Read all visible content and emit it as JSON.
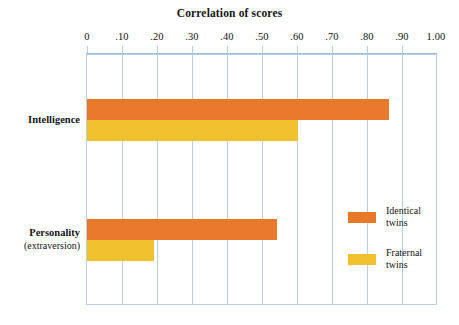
{
  "chart_data": {
    "type": "bar",
    "orientation": "horizontal",
    "title": "Correlation of scores",
    "xlabel": "Correlation of scores",
    "ylabel": "",
    "xlim": [
      0,
      1.0
    ],
    "grid": true,
    "legend_position": "right-inside",
    "categories": [
      "Intelligence",
      "Personality (extraversion)"
    ],
    "category_lines": [
      [
        "Intelligence"
      ],
      [
        "Personality",
        "(extraversion)"
      ]
    ],
    "tick_labels": [
      "0",
      ".10",
      ".20",
      ".30",
      ".40",
      ".50",
      ".60",
      ".70",
      ".80",
      ".90",
      "1.00"
    ],
    "tick_values": [
      0,
      0.1,
      0.2,
      0.3,
      0.4,
      0.5,
      0.6,
      0.7,
      0.8,
      0.9,
      1.0
    ],
    "series": [
      {
        "name": "Identical twins",
        "name_lines": [
          "Identical",
          "twins"
        ],
        "color": "#e8792b",
        "values": [
          0.86,
          0.54
        ]
      },
      {
        "name": "Fraternal twins",
        "name_lines": [
          "Fraternal",
          "twins"
        ],
        "color": "#f0c02e",
        "values": [
          0.6,
          0.19
        ]
      }
    ]
  },
  "axis": {
    "tick_0": "0",
    "tick_10": ".10",
    "tick_20": ".20",
    "tick_30": ".30",
    "tick_40": ".40",
    "tick_50": ".50",
    "tick_60": ".60",
    "tick_70": ".70",
    "tick_80": ".80",
    "tick_90": ".90",
    "tick_100": "1.00"
  },
  "categories": {
    "intelligence": "Intelligence",
    "personality_primary": "Personality",
    "personality_secondary": "(extraversion)"
  },
  "legend": {
    "identical_line1": "Identical",
    "identical_line2": "twins",
    "fraternal_line1": "Fraternal",
    "fraternal_line2": "twins"
  },
  "colors": {
    "identical": "#e8792b",
    "fraternal": "#f0c02e",
    "grid": "#b9cfe2",
    "text": "#141414",
    "background": "#ffffff"
  }
}
